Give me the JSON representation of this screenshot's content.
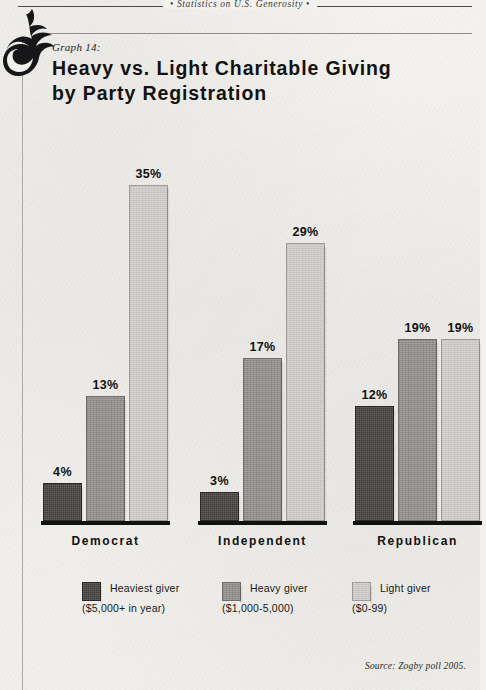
{
  "page": {
    "running_head": "•  Statistics on U.S. Generosity  •",
    "ornament": "flourish-ornament",
    "background_color": "#f2f1ee"
  },
  "header": {
    "graph_number": "Graph 14:",
    "title_line1": "Heavy vs. Light Charitable Giving",
    "title_line2": "by Party Registration"
  },
  "footer": {
    "source": "Source:  Zogby poll 2005."
  },
  "legend": [
    {
      "name": "Heaviest giver",
      "range": "($5,000+ in year)",
      "color": "#3e3d3b",
      "swatch": "dark"
    },
    {
      "name": "Heavy giver",
      "range": "($1,000-5,000)",
      "color": "#8f8e8b",
      "swatch": "mid"
    },
    {
      "name": "Light giver",
      "range": "($0-99)",
      "color": "#c9c8c4",
      "swatch": "light"
    }
  ],
  "chart_data": {
    "type": "bar",
    "title": "Heavy vs. Light Charitable Giving by Party Registration",
    "subtitle": "Graph 14:",
    "xlabel": "",
    "ylabel": "",
    "ylim": [
      0,
      35
    ],
    "grid": false,
    "legend_position": "bottom",
    "value_suffix": "%",
    "categories": [
      "Democrat",
      "Independent",
      "Republican"
    ],
    "series": [
      {
        "name": "Heaviest giver",
        "range": "($5,000+ in year)",
        "color": "#3e3d3b",
        "values": [
          4,
          3,
          12
        ],
        "labels": [
          "4%",
          "3%",
          "12%"
        ]
      },
      {
        "name": "Heavy giver",
        "range": "($1,000-5,000)",
        "color": "#8f8e8b",
        "values": [
          13,
          17,
          19
        ],
        "labels": [
          "13%",
          "17%",
          "19%"
        ]
      },
      {
        "name": "Light giver",
        "range": "($0-99)",
        "color": "#c9c8c4",
        "values": [
          35,
          29,
          19
        ],
        "labels": [
          "35%",
          "29%",
          "19%"
        ]
      }
    ]
  }
}
